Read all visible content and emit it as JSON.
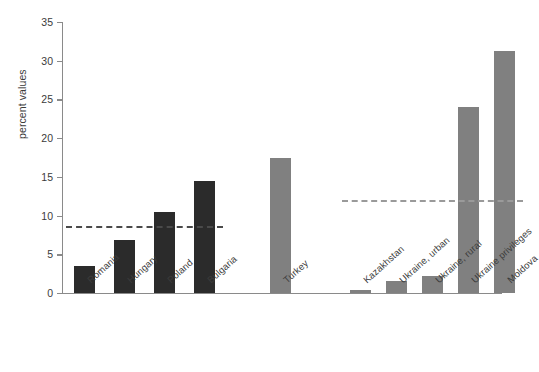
{
  "chart_data": {
    "type": "bar",
    "title": "",
    "subtitle": "",
    "xlabel": "",
    "ylabel": "percent values",
    "ylim": [
      0,
      35
    ],
    "yticks": [
      0,
      5,
      10,
      15,
      20,
      25,
      30,
      35
    ],
    "ytick_labels": [
      "0",
      "5",
      "10",
      "15",
      "20",
      "25",
      "30",
      "35"
    ],
    "grid": false,
    "legend": "none",
    "categories": [
      "Romania",
      "Hungary",
      "Poland",
      "Bulgaria",
      "Turkey",
      "Kazakhstan",
      "Ukraine, urban",
      "Ukraine, rural",
      "Ukraine privileges",
      "Moldova"
    ],
    "values": [
      3.5,
      6.8,
      10.4,
      14.5,
      17.4,
      0.4,
      1.5,
      2.2,
      24.0,
      31.2
    ],
    "bar_colors": [
      "#2b2b2b",
      "#2b2b2b",
      "#2b2b2b",
      "#2b2b2b",
      "#808080",
      "#808080",
      "#808080",
      "#808080",
      "#808080",
      "#808080"
    ],
    "annotations": [
      {
        "name": "reference-line-left",
        "type": "hline",
        "value": 8.7,
        "style": "dashed",
        "color": "#4a4a4a",
        "x_start_category": "Romania",
        "x_end_category": "Bulgaria"
      },
      {
        "name": "reference-line-right",
        "type": "hline",
        "value": 12.0,
        "style": "dashed",
        "color": "#9a9a9a",
        "x_start_category": "Kazakhstan",
        "x_end_category": "Moldova"
      }
    ]
  },
  "axis": {
    "y_title": "percent values"
  }
}
